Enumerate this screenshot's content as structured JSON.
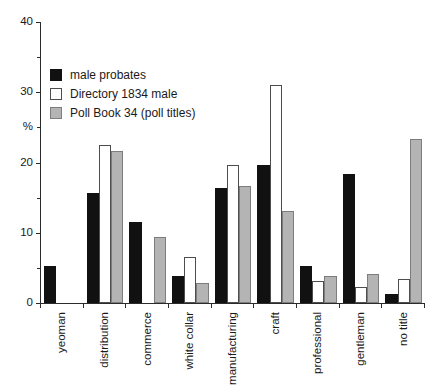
{
  "chart_data": {
    "type": "bar",
    "title": "",
    "subtitle": "",
    "xlabel": "",
    "ylabel": "%",
    "ylim": [
      0,
      40
    ],
    "yticks": [
      0,
      10,
      20,
      30,
      40
    ],
    "yminor_ticks": [
      5,
      15,
      25,
      35
    ],
    "ytick_labels": [
      "0",
      "10",
      "20",
      "30",
      "40"
    ],
    "grid": false,
    "legend_position": "upper-left-inside",
    "categories": [
      "yeoman",
      "distribution",
      "commerce",
      "white collar",
      "manufacturing",
      "craft",
      "professional",
      "gentleman",
      "no title"
    ],
    "series": [
      {
        "name": "male probates",
        "color": "#111111",
        "values": [
          5.3,
          15.6,
          11.5,
          3.9,
          16.4,
          19.6,
          5.2,
          18.3,
          1.3
        ]
      },
      {
        "name": "Directory 1834 male",
        "color": "#ffffff",
        "values": [
          0.0,
          22.5,
          0.0,
          6.6,
          19.6,
          31.0,
          3.2,
          2.3,
          3.4
        ]
      },
      {
        "name": "Poll Book 34 (poll titles)",
        "color": "#b4b4b4",
        "values": [
          0.0,
          21.6,
          9.4,
          2.9,
          16.7,
          13.1,
          3.8,
          4.2,
          23.4
        ]
      }
    ]
  },
  "legend": {
    "items": [
      {
        "label": "male probates",
        "swatch": "black-filled-square"
      },
      {
        "label": "Directory 1834 male",
        "swatch": "white-outlined-square"
      },
      {
        "label": "Poll Book 34 (poll titles)",
        "swatch": "gray-filled-square"
      }
    ]
  },
  "axes": {
    "y_unit_label": "%"
  }
}
